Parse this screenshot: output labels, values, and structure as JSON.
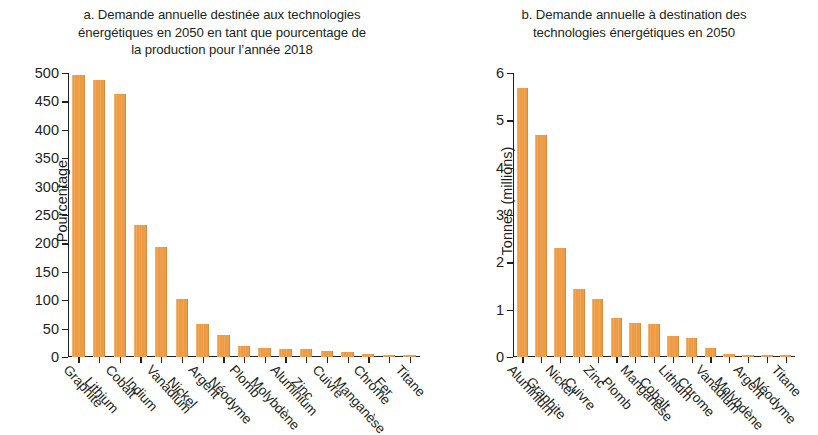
{
  "figure": {
    "background": "#ffffff",
    "bar_color": "#ed9a43"
  },
  "panel_a": {
    "title": "a. Demande annuelle destinée aux technologies\nénergétiques en 2050 en tant que pourcentage de\nla production pour l’année 2018"
  },
  "panel_b": {
    "title": "b. Demande annuelle à destination des\ntechnologies énergétiques en 2050"
  },
  "chart_data": [
    {
      "id": "panel-a",
      "type": "bar",
      "title": "a. Demande annuelle destinée aux technologies énergétiques en 2050 en tant que pourcentage de la production pour l’année 2018",
      "xlabel": "",
      "ylabel": "Pourcentage",
      "ylim": [
        0,
        500
      ],
      "yticks": [
        0,
        50,
        100,
        150,
        200,
        250,
        300,
        350,
        400,
        450,
        500
      ],
      "grid": false,
      "legend": "none",
      "categories": [
        "Graphite",
        "Lithium",
        "Cobalt",
        "Indium",
        "Vanadium",
        "Nickel",
        "Argent",
        "Néodyme",
        "Plomb",
        "Molybdène",
        "Aluminium",
        "Zinc",
        "Cuivre",
        "Manganèse",
        "Chrome",
        "Fer",
        "Titane"
      ],
      "values": [
        496,
        488,
        463,
        232,
        193,
        102,
        58,
        38,
        20,
        16,
        14,
        14,
        10,
        9,
        5,
        2,
        2
      ],
      "bar_color": "#ed9a43"
    },
    {
      "id": "panel-b",
      "type": "bar",
      "title": "b. Demande annuelle à destination des technologies énergétiques en 2050",
      "xlabel": "",
      "ylabel": "Tonnes (millions)",
      "ylim": [
        0,
        6
      ],
      "yticks": [
        0,
        1,
        2,
        3,
        4,
        5,
        6
      ],
      "grid": false,
      "legend": "none",
      "categories": [
        "Aluminium",
        "Graphite",
        "Nickel",
        "Cuivre",
        "Zinc",
        "Plomb",
        "Manganèse",
        "Cobalt",
        "Lithium",
        "Chrome",
        "Vanadium",
        "Molybdène",
        "Argent",
        "Néodyme",
        "Titane"
      ],
      "values": [
        5.68,
        4.69,
        2.31,
        1.43,
        1.23,
        0.82,
        0.72,
        0.69,
        0.45,
        0.41,
        0.18,
        0.06,
        0.03,
        0.03,
        0.03
      ],
      "bar_color": "#ed9a43"
    }
  ]
}
